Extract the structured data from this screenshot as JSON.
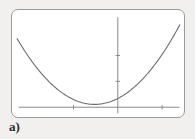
{
  "figure": {
    "label": "a)",
    "card": {
      "background_color": "#ffffff",
      "border_color": "#9a9a99"
    },
    "page_background_color": "#f1f0ee"
  },
  "chart_data": {
    "type": "line",
    "title": "",
    "xlabel": "",
    "ylabel": "",
    "subtitle": "",
    "grid": false,
    "legend": null,
    "axis_color": "#8a8a8a",
    "curve_color": "#6e6e72",
    "xlim": [
      -4.6,
      2.9
    ],
    "ylim": [
      -0.6,
      7.2
    ],
    "x_axis_y_value": 0,
    "y_axis_x_value": 0,
    "x_ticks": [
      -2,
      0,
      2
    ],
    "y_ticks": [
      2,
      4
    ],
    "x_tick_labels": [
      "",
      "",
      ""
    ],
    "y_tick_labels": [
      "",
      ""
    ],
    "curve": {
      "equation": "y = 0.42*(x + 1.05)^2 + 0.22",
      "vertex": [
        -1.05,
        0.22
      ],
      "x": [
        -4.55,
        -4.2,
        -3.85,
        -3.5,
        -3.15,
        -2.8,
        -2.45,
        -2.1,
        -1.75,
        -1.4,
        -1.05,
        -0.7,
        -0.35,
        0,
        0.35,
        0.7,
        1.05,
        1.4,
        1.75,
        2.1,
        2.45,
        2.8
      ],
      "y": [
        5.58,
        4.87,
        4.21,
        3.6,
        3.04,
        2.53,
        2.07,
        1.66,
        1.3,
        0.99,
        0.22,
        0.27,
        0.42,
        0.68,
        1.04,
        1.5,
        2.06,
        2.72,
        3.48,
        4.34,
        5.3,
        6.36
      ]
    }
  }
}
